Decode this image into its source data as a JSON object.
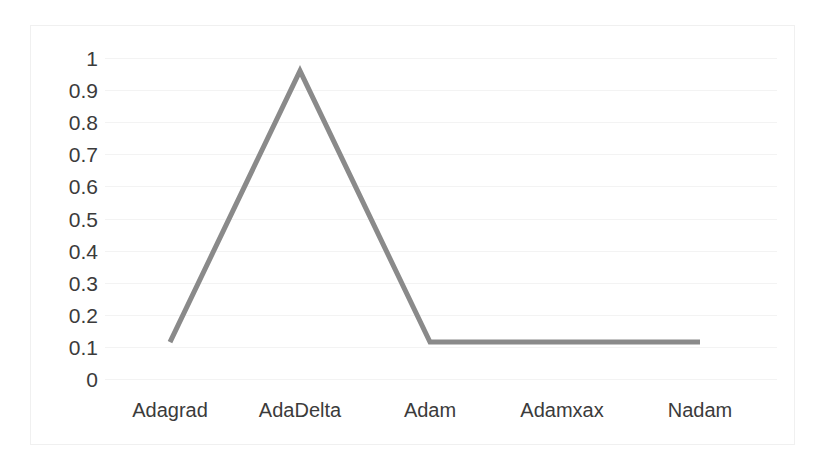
{
  "chart_data": {
    "type": "line",
    "title": "",
    "subtitle": "",
    "xlabel": "",
    "ylabel": "",
    "categories": [
      "Adagrad",
      "AdaDelta",
      "Adam",
      "Adamxax",
      "Nadam"
    ],
    "series": [
      {
        "name": "",
        "values": [
          0.115,
          0.96,
          0.115,
          0.115,
          0.115
        ],
        "color": "#8a8a8a",
        "line_width": 5,
        "markers": "none"
      }
    ],
    "values": [
      0.115,
      0.96,
      0.115,
      0.115,
      0.115
    ],
    "ylim": [
      0,
      1
    ],
    "ytick_labels": [
      "1",
      "0.9",
      "0.8",
      "0.7",
      "0.6",
      "0.5",
      "0.4",
      "0.3",
      "0.2",
      "0.1",
      "0"
    ],
    "ytick_values": [
      1,
      0.9,
      0.8,
      0.7,
      0.6,
      0.5,
      0.4,
      0.3,
      0.2,
      0.1,
      0
    ],
    "grid": {
      "horizontal": true,
      "vertical": false,
      "color": "#f3f3f3"
    },
    "legend": {
      "visible": false,
      "position": "none",
      "entries": []
    },
    "axes": {
      "x_axis_line": false,
      "y_axis_line": false,
      "plot_border": true,
      "plot_border_color": "#f0f0f0"
    },
    "background_color": "#ffffff"
  }
}
